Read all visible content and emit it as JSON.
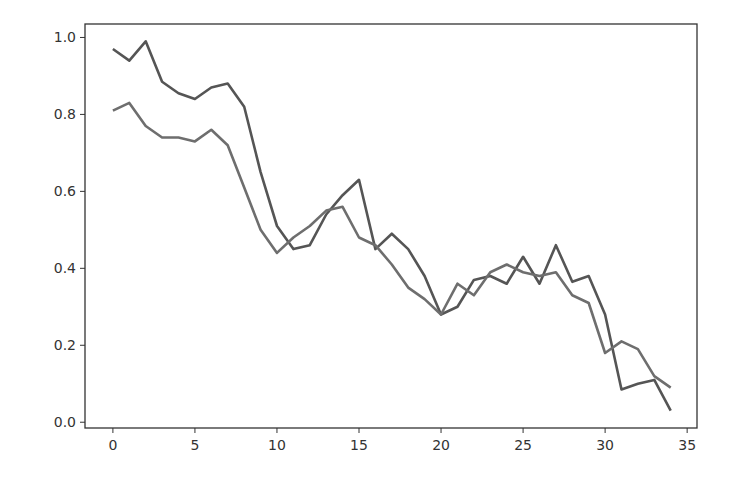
{
  "chart_data": {
    "type": "line",
    "title": "",
    "xlabel": "",
    "ylabel": "",
    "xlim": [
      -1.7,
      35.6
    ],
    "ylim": [
      -0.015,
      1.035
    ],
    "grid": false,
    "legend": null,
    "x_ticks": [
      0,
      5,
      10,
      15,
      20,
      25,
      30,
      35
    ],
    "x_tick_labels": [
      "0",
      "5",
      "10",
      "15",
      "20",
      "25",
      "30",
      "35"
    ],
    "y_ticks": [
      0.0,
      0.2,
      0.4,
      0.6,
      0.8,
      1.0
    ],
    "y_tick_labels": [
      "0.0",
      "0.2",
      "0.4",
      "0.6",
      "0.8",
      "1.0"
    ],
    "x": [
      0,
      1,
      2,
      3,
      4,
      5,
      6,
      7,
      8,
      9,
      10,
      11,
      12,
      13,
      14,
      15,
      16,
      17,
      18,
      19,
      20,
      21,
      22,
      23,
      24,
      25,
      26,
      27,
      28,
      29,
      30,
      31,
      32,
      33,
      34
    ],
    "series": [
      {
        "name": "series-1",
        "color": "#555555",
        "values": [
          0.97,
          0.94,
          0.99,
          0.885,
          0.855,
          0.84,
          0.87,
          0.88,
          0.82,
          0.65,
          0.51,
          0.45,
          0.46,
          0.54,
          0.59,
          0.63,
          0.45,
          0.49,
          0.45,
          0.38,
          0.28,
          0.3,
          0.37,
          0.38,
          0.36,
          0.43,
          0.36,
          0.46,
          0.365,
          0.38,
          0.28,
          0.085,
          0.1,
          0.11,
          0.03
        ]
      },
      {
        "name": "series-2",
        "color": "#6e6e6e",
        "values": [
          0.81,
          0.83,
          0.77,
          0.74,
          0.74,
          0.73,
          0.76,
          0.72,
          0.61,
          0.5,
          0.44,
          0.48,
          0.51,
          0.55,
          0.56,
          0.48,
          0.46,
          0.41,
          0.35,
          0.32,
          0.28,
          0.36,
          0.33,
          0.39,
          0.41,
          0.39,
          0.38,
          0.39,
          0.33,
          0.31,
          0.18,
          0.21,
          0.19,
          0.12,
          0.09
        ]
      }
    ]
  },
  "layout": {
    "axes_left": 85,
    "axes_top": 24,
    "axes_right": 697,
    "axes_bottom": 428
  }
}
